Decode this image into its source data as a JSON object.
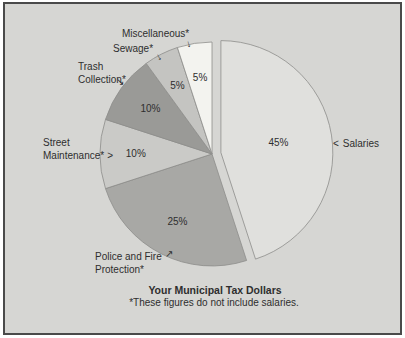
{
  "colors": {
    "page_bg": "#ffffff",
    "panel_bg": "#d6d6d3",
    "frame_border": "#4a4a4a",
    "slice_stroke": "#8d8d8a",
    "text": "#2e2e2e"
  },
  "chart_data": {
    "type": "pie",
    "title": "Your Municipal Tax Dollars",
    "footnote": "*These figures do not include salaries.",
    "start": "12-o-clock",
    "direction": "clockwise",
    "legend_position": "external-callout-labels",
    "slices": [
      {
        "label": "Salaries",
        "value": 45,
        "pct_label": "45%",
        "color": "#e0e0dd",
        "exploded": true
      },
      {
        "label": "Police and Fire Protection",
        "value": 25,
        "pct_label": "25%",
        "color": "#a8a8a5",
        "exploded": false
      },
      {
        "label": "Street Maintenance",
        "value": 10,
        "pct_label": "10%",
        "color": "#cacac7",
        "exploded": false
      },
      {
        "label": "Trash Collection",
        "value": 10,
        "pct_label": "10%",
        "color": "#9a9a97",
        "exploded": false
      },
      {
        "label": "Sewage",
        "value": 5,
        "pct_label": "5%",
        "color": "#c4c4c1",
        "exploded": false
      },
      {
        "label": "Miscellaneous",
        "value": 5,
        "pct_label": "5%",
        "color": "#f3f3ef",
        "exploded": false
      }
    ]
  },
  "callouts": {
    "miscellaneous": {
      "text": "Miscellaneous*",
      "arrow": "↓"
    },
    "sewage": {
      "text": "Sewage*",
      "arrow": "↓"
    },
    "trash": {
      "line1": "Trash",
      "line2": "Collection*",
      "arrow": "↘"
    },
    "street": {
      "line1": "Street",
      "line2": "Maintenance*",
      "arrow": ">"
    },
    "police": {
      "line1": "Police and Fire",
      "line2": "Protection*",
      "arrow": "↗"
    },
    "salaries": {
      "text": "Salaries",
      "arrow": "<"
    }
  }
}
